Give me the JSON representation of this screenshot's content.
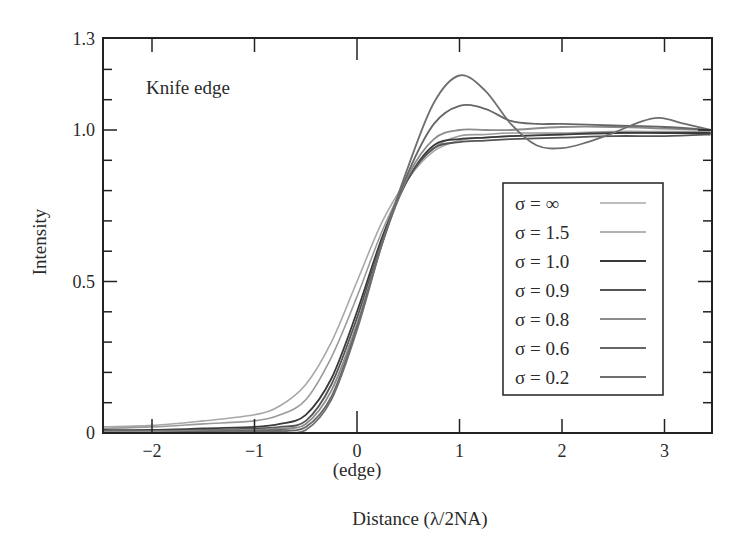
{
  "chart_data": {
    "type": "line",
    "title": "",
    "annotation": "Knife edge",
    "xlabel": "Distance (λ/2NA)",
    "xlabel_sub": "(edge)",
    "ylabel": "Intensity",
    "xlim": [
      -2.5,
      3.45
    ],
    "ylim": [
      0,
      1.3
    ],
    "x_ticks": [
      -2,
      -1,
      0,
      1,
      2,
      3
    ],
    "x_tick_labels": [
      "−2",
      "−1",
      "0",
      "1",
      "2",
      "3"
    ],
    "y_ticks": [
      0,
      0.5,
      1.0,
      1.3
    ],
    "y_tick_labels": [
      "0",
      "0.5",
      "1.0",
      "1.3"
    ],
    "y_minor_step": 0.1,
    "grid": false,
    "legend_position": "lower right (inside)",
    "series": [
      {
        "name": "σ = ∞",
        "color": "#a8a8a8",
        "width": 1.6,
        "x": [
          -2.5,
          -2,
          -1.5,
          -1,
          -0.75,
          -0.5,
          -0.25,
          0,
          0.25,
          0.5,
          0.75,
          1,
          1.25,
          1.5,
          2,
          2.5,
          3,
          3.45
        ],
        "values": [
          0.02,
          0.025,
          0.04,
          0.06,
          0.09,
          0.16,
          0.3,
          0.5,
          0.7,
          0.84,
          0.93,
          0.965,
          0.975,
          0.98,
          0.985,
          0.99,
          0.99,
          0.99
        ]
      },
      {
        "name": "σ = 1.5",
        "color": "#9a9a9a",
        "width": 1.6,
        "x": [
          -2.5,
          -2,
          -1.5,
          -1,
          -0.75,
          -0.5,
          -0.25,
          0,
          0.25,
          0.5,
          0.75,
          1,
          1.25,
          1.5,
          2,
          2.5,
          3,
          3.45
        ],
        "values": [
          0.015,
          0.02,
          0.03,
          0.04,
          0.06,
          0.11,
          0.25,
          0.45,
          0.67,
          0.84,
          0.94,
          0.98,
          0.985,
          0.99,
          0.99,
          0.995,
          0.995,
          0.995
        ]
      },
      {
        "name": "σ = 1.0",
        "color": "#3a3a3a",
        "width": 1.8,
        "x": [
          -2.5,
          -2,
          -1.5,
          -1,
          -0.75,
          -0.5,
          -0.25,
          0,
          0.25,
          0.5,
          0.75,
          1,
          1.25,
          1.5,
          2,
          2.5,
          3,
          3.45
        ],
        "values": [
          0.01,
          0.01,
          0.015,
          0.02,
          0.03,
          0.06,
          0.18,
          0.4,
          0.65,
          0.84,
          0.95,
          0.97,
          0.975,
          0.98,
          0.985,
          0.99,
          0.99,
          0.99
        ]
      },
      {
        "name": "σ = 0.9",
        "color": "#555555",
        "width": 1.8,
        "x": [
          -2.5,
          -2,
          -1.5,
          -1,
          -0.75,
          -0.5,
          -0.25,
          0,
          0.25,
          0.5,
          0.75,
          1,
          1.25,
          1.5,
          2,
          2.5,
          3,
          3.45
        ],
        "values": [
          0.005,
          0.008,
          0.01,
          0.015,
          0.02,
          0.04,
          0.16,
          0.38,
          0.64,
          0.84,
          0.94,
          0.96,
          0.965,
          0.97,
          0.975,
          0.98,
          0.98,
          0.985
        ]
      },
      {
        "name": "σ = 0.8",
        "color": "#8c8c8c",
        "width": 1.8,
        "x": [
          -2.5,
          -2,
          -1.5,
          -1,
          -0.75,
          -0.5,
          -0.25,
          0,
          0.25,
          0.5,
          0.75,
          1,
          1.25,
          1.5,
          2,
          2.5,
          3,
          3.45
        ],
        "values": [
          0.005,
          0.005,
          0.008,
          0.01,
          0.015,
          0.03,
          0.14,
          0.36,
          0.63,
          0.85,
          0.97,
          1.0,
          1.0,
          1.0,
          1.01,
          1.01,
          1.005,
          1.0
        ]
      },
      {
        "name": "σ = 0.6",
        "color": "#666666",
        "width": 1.8,
        "x": [
          -2.5,
          -2,
          -1.5,
          -1,
          -0.75,
          -0.5,
          -0.25,
          0,
          0.25,
          0.5,
          0.75,
          1,
          1.25,
          1.5,
          1.75,
          2,
          2.5,
          3,
          3.45
        ],
        "values": [
          0.0,
          0.0,
          0.005,
          0.008,
          0.01,
          0.02,
          0.12,
          0.35,
          0.63,
          0.86,
          1.02,
          1.08,
          1.07,
          1.03,
          1.02,
          1.02,
          1.015,
          1.01,
          1.0
        ]
      },
      {
        "name": "σ = 0.2",
        "color": "#6e6e6e",
        "width": 1.8,
        "x": [
          -2.5,
          -2,
          -1.5,
          -1,
          -0.75,
          -0.5,
          -0.25,
          0,
          0.25,
          0.5,
          0.75,
          1,
          1.25,
          1.5,
          1.75,
          2,
          2.25,
          2.5,
          2.75,
          2.95,
          3.2,
          3.45
        ],
        "values": [
          0.0,
          0.0,
          0.0,
          0.005,
          0.005,
          0.01,
          0.11,
          0.34,
          0.63,
          0.88,
          1.09,
          1.18,
          1.13,
          1.02,
          0.95,
          0.94,
          0.96,
          0.99,
          1.025,
          1.04,
          1.02,
          1.0
        ]
      }
    ]
  },
  "legend": {
    "entries": [
      "σ =  ∞",
      "σ = 1.5",
      "σ = 1.0",
      "σ = 0.9",
      "σ = 0.8",
      "σ = 0.6",
      "σ = 0.2"
    ]
  }
}
